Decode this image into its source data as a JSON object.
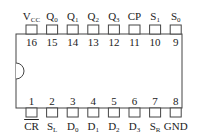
{
  "diagram": {
    "type": "IC pinout (DIP-16)",
    "top_pins": [
      {
        "num": "16",
        "label": "V",
        "sub": "CC",
        "overline": false
      },
      {
        "num": "15",
        "label": "Q",
        "sub": "0",
        "overline": false
      },
      {
        "num": "14",
        "label": "Q",
        "sub": "1",
        "overline": false
      },
      {
        "num": "13",
        "label": "Q",
        "sub": "2",
        "overline": false
      },
      {
        "num": "12",
        "label": "Q",
        "sub": "3",
        "overline": false
      },
      {
        "num": "11",
        "label": "CP",
        "sub": "",
        "overline": false
      },
      {
        "num": "10",
        "label": "S",
        "sub": "1",
        "overline": false
      },
      {
        "num": "9",
        "label": "S",
        "sub": "0",
        "overline": false
      }
    ],
    "bottom_pins": [
      {
        "num": "1",
        "label": "CR",
        "sub": "",
        "overline": true
      },
      {
        "num": "2",
        "label": "S",
        "sub": "L",
        "overline": false
      },
      {
        "num": "3",
        "label": "D",
        "sub": "0",
        "overline": false
      },
      {
        "num": "4",
        "label": "D",
        "sub": "1",
        "overline": false
      },
      {
        "num": "5",
        "label": "D",
        "sub": "2",
        "overline": false
      },
      {
        "num": "6",
        "label": "D",
        "sub": "3",
        "overline": false
      },
      {
        "num": "7",
        "label": "S",
        "sub": "R",
        "overline": false
      },
      {
        "num": "8",
        "label": "GND",
        "sub": "",
        "overline": false
      }
    ],
    "colors": {
      "line": "#444444",
      "background": "#ffffff"
    }
  }
}
